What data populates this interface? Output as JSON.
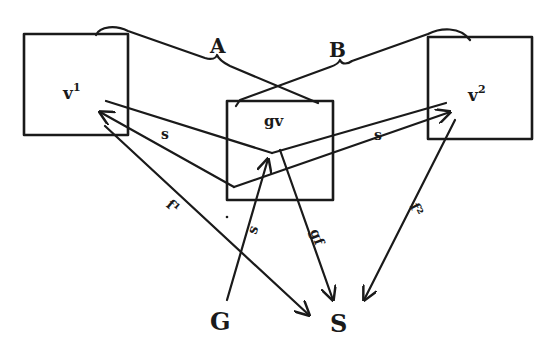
{
  "diagram": {
    "type": "flow-diagram",
    "colors": {
      "ink": "#1a1a1a",
      "background": "#ffffff"
    },
    "top_partial_text": "",
    "nodes": [
      {
        "id": "v1",
        "label": "v",
        "superscript": "1"
      },
      {
        "id": "gv",
        "label": "gv",
        "superscript": ""
      },
      {
        "id": "v2",
        "label": "v",
        "superscript": "2"
      }
    ],
    "brackets": [
      {
        "id": "A",
        "label": "A"
      },
      {
        "id": "B",
        "label": "B"
      }
    ],
    "terminals": [
      {
        "id": "G",
        "label": "G"
      },
      {
        "id": "S",
        "label": "S"
      }
    ],
    "edge_labels": {
      "s_left": "s",
      "s_right": "s",
      "s_vertical": "s",
      "f1": "f¹",
      "gf": "gf",
      "f2": "f²"
    },
    "edges": [
      {
        "from": "gv",
        "to": "v1",
        "label": "s"
      },
      {
        "from": "gv",
        "to": "v2",
        "label": "s"
      },
      {
        "from": "G",
        "to": "gv",
        "label": "s"
      },
      {
        "from": "v1",
        "to": "S",
        "label": "f¹"
      },
      {
        "from": "gv",
        "to": "S",
        "label": "gf"
      },
      {
        "from": "v2",
        "to": "S",
        "label": "f²"
      }
    ]
  }
}
